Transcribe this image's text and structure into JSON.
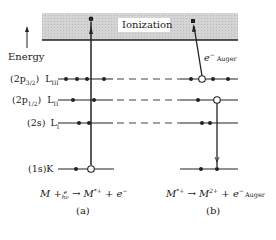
{
  "diagram": {
    "ionization_label": "Ionization",
    "axis_label": "Energy",
    "levels": [
      {
        "orbital": "(2p3/2)",
        "orbital_main": "(2p",
        "orbital_sub": "3/2",
        "orbital_close": ")",
        "shell": "L",
        "shell_sub": "III"
      },
      {
        "orbital": "(2p1/2)",
        "orbital_main": "(2p",
        "orbital_sub": "1/2",
        "orbital_close": ")",
        "shell": "L",
        "shell_sub": "II"
      },
      {
        "orbital": "(2s)",
        "orbital_main": "(2s)",
        "shell": "L",
        "shell_sub": "I"
      },
      {
        "orbital": "(1s)",
        "orbital_main": "(1s)",
        "shell": "K",
        "shell_sub": ""
      }
    ],
    "auger_label": {
      "main": "e",
      "sup": "−",
      "sub": "Auger"
    },
    "panel_a": {
      "equation": {
        "m": "M",
        "plus": "+",
        "photon_sup": "e",
        "photon_sub": "hν",
        "arrow": "→",
        "product": "M",
        "product_sup": "*+",
        "plus2": "+",
        "electron": "e",
        "electron_sup": "−"
      },
      "caption": "(a)"
    },
    "panel_b": {
      "equation": {
        "reactant": "M",
        "reactant_sup": "*+",
        "arrow": "→",
        "product": "M",
        "product_sup": "2+",
        "plus": "+",
        "electron": "e",
        "electron_sup": "−",
        "electron_sub": "Auger"
      },
      "caption": "(b)"
    },
    "colors": {
      "ionization_fill": "#d9d9d9",
      "line": "#222222"
    }
  }
}
